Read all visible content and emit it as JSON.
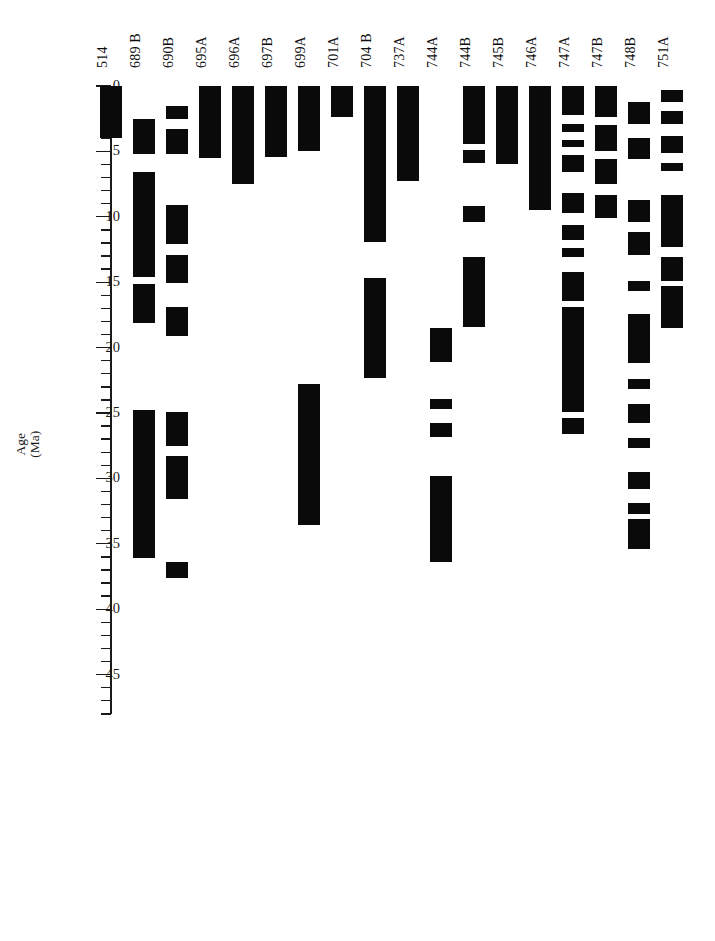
{
  "figure": {
    "title": "",
    "axis_label": "Age\n(Ma)",
    "background_color": "#ffffff",
    "bar_color": "#0a0a0a",
    "axis_color": "#1a1a1a"
  },
  "chart_data": {
    "type": "bar",
    "orientation": "vertical-ranges",
    "title": "",
    "xlabel": "",
    "ylabel": "Age (Ma)",
    "ylim": [
      0,
      48
    ],
    "y_inverted": true,
    "grid": false,
    "legend": "none",
    "major_tick_interval": 5,
    "minor_tick_interval": 1,
    "tick_labels": [
      "0",
      "5",
      "10",
      "15",
      "20",
      "25",
      "30",
      "35",
      "40",
      "45"
    ],
    "tick_values": [
      0,
      5,
      10,
      15,
      20,
      25,
      30,
      35,
      40,
      45
    ],
    "categories": [
      "514",
      "689 B",
      "690B",
      "695A",
      "696A",
      "697B",
      "699A",
      "701A",
      "704 B",
      "737A",
      "744A",
      "744B",
      "745B",
      "746A",
      "747A",
      "747B",
      "748B",
      "751A"
    ],
    "series": [
      {
        "name": "514",
        "label": "514",
        "intervals": [
          [
            0.0,
            4.0
          ]
        ]
      },
      {
        "name": "689 B",
        "label": "689 B",
        "intervals": [
          [
            2.5,
            5.2
          ],
          [
            6.6,
            14.6
          ],
          [
            15.1,
            18.1
          ],
          [
            24.8,
            36.1
          ]
        ]
      },
      {
        "name": "690B",
        "label": "690B",
        "intervals": [
          [
            1.5,
            2.5
          ],
          [
            3.3,
            5.2
          ],
          [
            9.1,
            12.1
          ],
          [
            12.9,
            15.1
          ],
          [
            16.9,
            19.1
          ],
          [
            24.9,
            27.5
          ],
          [
            28.3,
            31.6
          ],
          [
            36.4,
            37.6
          ]
        ]
      },
      {
        "name": "695A",
        "label": "695A",
        "intervals": [
          [
            0.0,
            5.5
          ]
        ]
      },
      {
        "name": "696A",
        "label": "696A",
        "intervals": [
          [
            0.0,
            7.5
          ]
        ]
      },
      {
        "name": "697B",
        "label": "697B",
        "intervals": [
          [
            0.0,
            5.4
          ]
        ]
      },
      {
        "name": "699A",
        "label": "699A",
        "intervals": [
          [
            0.0,
            5.0
          ],
          [
            22.8,
            33.6
          ]
        ]
      },
      {
        "name": "701A",
        "label": "701A",
        "intervals": [
          [
            0.0,
            2.4
          ]
        ]
      },
      {
        "name": "704 B",
        "label": "704 B",
        "intervals": [
          [
            0.0,
            11.9
          ],
          [
            14.7,
            22.3
          ]
        ]
      },
      {
        "name": "737A",
        "label": "737A",
        "intervals": [
          [
            0.0,
            7.3
          ]
        ]
      },
      {
        "name": "744A",
        "label": "744A",
        "intervals": [
          [
            18.5,
            21.1
          ],
          [
            23.9,
            24.7
          ],
          [
            25.8,
            26.8
          ],
          [
            29.8,
            36.4
          ]
        ]
      },
      {
        "name": "744B",
        "label": "744B",
        "intervals": [
          [
            0.0,
            4.4
          ],
          [
            4.9,
            5.9
          ],
          [
            9.2,
            10.4
          ],
          [
            13.1,
            18.4
          ]
        ]
      },
      {
        "name": "745B",
        "label": "745B",
        "intervals": [
          [
            0.0,
            6.0
          ]
        ]
      },
      {
        "name": "746A",
        "label": "746A",
        "intervals": [
          [
            0.0,
            9.5
          ]
        ]
      },
      {
        "name": "747A",
        "label": "747A",
        "intervals": [
          [
            0.0,
            2.2
          ],
          [
            2.9,
            3.5
          ],
          [
            4.1,
            4.7
          ],
          [
            5.3,
            6.6
          ],
          [
            8.2,
            9.7
          ],
          [
            10.6,
            11.8
          ],
          [
            12.4,
            13.1
          ],
          [
            14.2,
            16.4
          ],
          [
            16.9,
            24.9
          ],
          [
            25.4,
            26.6
          ]
        ]
      },
      {
        "name": "747B",
        "label": "747B",
        "intervals": [
          [
            0.0,
            2.4
          ],
          [
            3.0,
            5.0
          ],
          [
            5.6,
            7.5
          ],
          [
            8.3,
            10.1
          ]
        ]
      },
      {
        "name": "748B",
        "label": "748B",
        "intervals": [
          [
            1.2,
            2.9
          ],
          [
            4.0,
            5.6
          ],
          [
            8.7,
            10.4
          ],
          [
            11.2,
            12.9
          ],
          [
            14.9,
            15.7
          ],
          [
            17.4,
            21.2
          ],
          [
            22.4,
            23.2
          ],
          [
            24.3,
            25.8
          ],
          [
            26.9,
            27.7
          ],
          [
            29.5,
            30.8
          ],
          [
            31.9,
            32.7
          ],
          [
            33.1,
            35.4
          ]
        ]
      },
      {
        "name": "751A",
        "label": "751A",
        "intervals": [
          [
            0.3,
            1.2
          ],
          [
            1.9,
            2.9
          ],
          [
            3.8,
            5.1
          ],
          [
            5.9,
            6.5
          ],
          [
            8.3,
            12.3
          ],
          [
            13.1,
            14.9
          ],
          [
            15.3,
            18.5
          ]
        ]
      }
    ]
  }
}
